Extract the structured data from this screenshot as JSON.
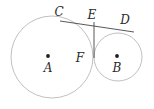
{
  "figure": {
    "canvas": {
      "width": 154,
      "height": 109,
      "background": "#ffffff"
    },
    "stroke_colors": {
      "circle": "#b9b9b9",
      "line": "#3a3a3a",
      "point": "#1d1d1d",
      "label": "#2b2b2b"
    },
    "circles": [
      {
        "id": "circle-a",
        "center_label": "A",
        "cx": 52,
        "cy": 57,
        "r": 41
      },
      {
        "id": "circle-b",
        "center_label": "B",
        "cx": 118,
        "cy": 57,
        "r": 24
      }
    ],
    "points": [
      {
        "id": "point-a",
        "label": "A",
        "x": 48,
        "y": 56,
        "label_x": 48,
        "label_y": 72,
        "dot": true
      },
      {
        "id": "point-b",
        "label": "B",
        "x": 117,
        "y": 56,
        "label_x": 117,
        "label_y": 72,
        "dot": true
      },
      {
        "id": "point-c",
        "label": "C",
        "x": 60,
        "y": 21,
        "label_x": 59,
        "label_y": 16,
        "dot": false
      },
      {
        "id": "point-e",
        "label": "E",
        "x": 94,
        "y": 23,
        "label_x": 92,
        "label_y": 19,
        "dot": false
      },
      {
        "id": "point-d",
        "label": "D",
        "x": 134,
        "y": 32,
        "label_x": 125,
        "label_y": 24,
        "dot": false
      },
      {
        "id": "point-f",
        "label": "F",
        "x": 94,
        "y": 57,
        "label_x": 80,
        "label_y": 62,
        "dot": false
      }
    ],
    "segments": [
      {
        "id": "segment-cd",
        "from": "C",
        "to": "D",
        "x1": 60,
        "y1": 21,
        "x2": 134,
        "y2": 32
      },
      {
        "id": "segment-ef",
        "from": "E",
        "to": "F",
        "x1": 94,
        "y1": 22,
        "x2": 94,
        "y2": 58
      }
    ],
    "labels": {
      "a": "A",
      "b": "B",
      "c": "C",
      "d": "D",
      "e": "E",
      "f": "F"
    }
  }
}
